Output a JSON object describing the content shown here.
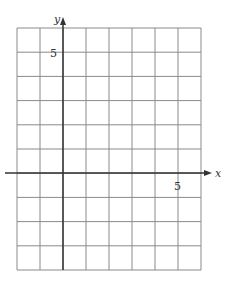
{
  "chart_data": {
    "type": "grid",
    "title": "",
    "xlabel": "x",
    "ylabel": "y",
    "x_range": [
      -2,
      6
    ],
    "y_range": [
      -4,
      6
    ],
    "grid": true,
    "tick_labels": {
      "x": [
        "5"
      ],
      "y": [
        "5"
      ]
    },
    "series": []
  },
  "labels": {
    "x_axis": "x",
    "y_axis": "y",
    "x_tick_5": "5",
    "y_tick_5": "5"
  },
  "colors": {
    "grid": "#8a8a8a",
    "axis": "#333333"
  }
}
